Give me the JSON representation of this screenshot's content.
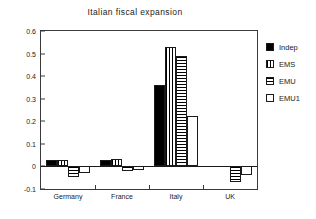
{
  "chart_data": {
    "type": "bar",
    "title": "Italian fiscal expansion",
    "xlabel": "",
    "ylabel": "",
    "ylim": [
      -0.1,
      0.6
    ],
    "yticks": [
      -0.1,
      0,
      0.1,
      0.2,
      0.3,
      0.4,
      0.5,
      0.6
    ],
    "ytick_labels": [
      "-0.1",
      "0",
      "0.1",
      "0.2",
      "0.3",
      "0.4",
      "0.5",
      "0.6"
    ],
    "grid": false,
    "legend_position": "right",
    "categories": [
      "Germany",
      "France",
      "Italy",
      "UK"
    ],
    "series": [
      {
        "name": "Indep",
        "fill": "solid",
        "values": [
          0.028,
          0.028,
          0.36,
          0
        ]
      },
      {
        "name": "EMS",
        "fill": "vertical",
        "values": [
          0.028,
          0.032,
          0.53,
          0
        ]
      },
      {
        "name": "EMU",
        "fill": "horizontal",
        "values": [
          -0.047,
          -0.022,
          0.49,
          -0.068
        ]
      },
      {
        "name": "EMU1",
        "fill": "empty",
        "values": [
          -0.03,
          -0.014,
          0.225,
          -0.037
        ]
      }
    ]
  },
  "legend": {
    "entries": [
      {
        "label": "Indep",
        "swatch": "solid-swatch-icon"
      },
      {
        "label": "EMS",
        "swatch": "vertical-hatch-swatch-icon"
      },
      {
        "label": "EMU",
        "swatch": "horizontal-hatch-swatch-icon"
      },
      {
        "label": "EMU1",
        "swatch": "empty-swatch-icon"
      }
    ]
  }
}
